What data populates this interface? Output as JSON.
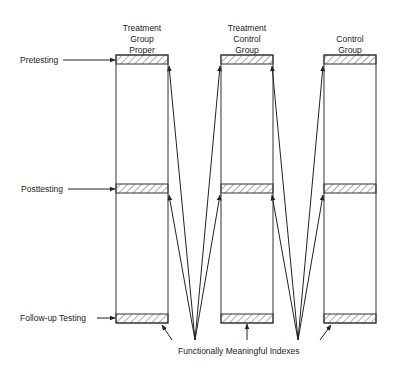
{
  "groups": [
    {
      "label_lines": [
        "Treatment",
        "Group",
        "Proper"
      ]
    },
    {
      "label_lines": [
        "Treatment",
        "Control",
        "Group"
      ]
    },
    {
      "label_lines": [
        "Control",
        "Group"
      ]
    }
  ],
  "phases": [
    "Pretesting",
    "Posttesting",
    "Follow-up Testing"
  ],
  "footer": "Functionally Meaningful Indexes",
  "colors": {
    "line": "#222222",
    "hatch": "#444444",
    "background": "#ffffff"
  }
}
